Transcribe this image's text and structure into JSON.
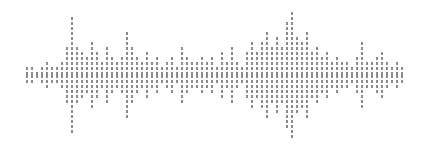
{
  "meta": {
    "title": "Audio Waveform Visualization",
    "width": 425,
    "height": 149,
    "background_color": "#ffffff"
  },
  "waveform": {
    "label": "audio waveform",
    "bar_color": "#8c8c8c",
    "bar_width": 2,
    "bar_spacing": 5,
    "dash_length": 3,
    "dash_gap": 2,
    "center_y": 75,
    "start_x": 26,
    "bar_count": 76
  },
  "chart_data": {
    "type": "bar",
    "title": "Audio Waveform Visualization",
    "xlabel": "",
    "ylabel": "Amplitude",
    "grid": false,
    "legend": null,
    "orientation": "vertical-centered",
    "x": [
      26,
      31,
      36,
      41,
      46,
      51,
      56,
      61,
      66,
      71,
      76,
      81,
      86,
      91,
      96,
      101,
      106,
      111,
      116,
      121,
      126,
      131,
      136,
      141,
      146,
      151,
      156,
      161,
      166,
      171,
      176,
      181,
      186,
      191,
      196,
      201,
      206,
      211,
      216,
      221,
      226,
      231,
      236,
      241,
      246,
      251,
      256,
      261,
      266,
      271,
      276,
      281,
      286,
      291,
      296,
      301,
      306,
      311,
      316,
      321,
      326,
      331,
      336,
      341,
      346,
      351,
      356,
      361,
      366,
      371,
      376,
      381,
      386,
      391,
      396,
      401
    ],
    "values": [
      5,
      9,
      4,
      7,
      14,
      9,
      6,
      12,
      25,
      57,
      26,
      21,
      19,
      32,
      24,
      13,
      26,
      18,
      11,
      15,
      43,
      27,
      18,
      14,
      22,
      12,
      15,
      9,
      13,
      19,
      8,
      27,
      15,
      12,
      10,
      19,
      13,
      17,
      9,
      21,
      14,
      26,
      11,
      8,
      24,
      34,
      23,
      30,
      43,
      29,
      36,
      26,
      52,
      63,
      38,
      30,
      41,
      22,
      29,
      17,
      23,
      13,
      19,
      11,
      14,
      9,
      17,
      30,
      13,
      10,
      16,
      23,
      12,
      8,
      14,
      5
    ],
    "ylim": [
      -65,
      65
    ]
  }
}
